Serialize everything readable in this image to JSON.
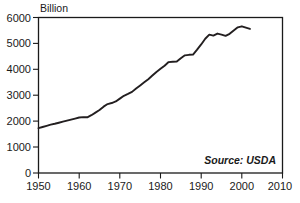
{
  "chart_data": {
    "type": "line",
    "title": "",
    "subtitle": "",
    "ylabel": "Billion",
    "xlabel": "",
    "xlim": [
      1950,
      2010
    ],
    "ylim": [
      0,
      6000
    ],
    "grid": false,
    "legend": null,
    "annotations": [
      {
        "name": "source",
        "text": "Source: USDA",
        "position": "bottom-right-inside"
      }
    ],
    "xticks": [
      1950,
      1960,
      1970,
      1980,
      1990,
      2000,
      2010
    ],
    "xtick_labels": [
      "1950",
      "1960",
      "1970",
      "1980",
      "1990",
      "2000",
      "2010"
    ],
    "yticks": [
      0,
      1000,
      2000,
      3000,
      4000,
      5000,
      6000
    ],
    "ytick_labels": [
      "0",
      "1000",
      "2000",
      "3000",
      "4000",
      "5000",
      "6000"
    ],
    "series": [
      {
        "name": "Production",
        "color": "#231f20",
        "x": [
          1950,
          1951,
          1952,
          1953,
          1954,
          1955,
          1956,
          1957,
          1958,
          1959,
          1960,
          1961,
          1962,
          1963,
          1964,
          1965,
          1966,
          1967,
          1968,
          1969,
          1970,
          1971,
          1972,
          1973,
          1974,
          1975,
          1976,
          1977,
          1978,
          1979,
          1980,
          1981,
          1982,
          1983,
          1984,
          1985,
          1986,
          1987,
          1988,
          1989,
          1990,
          1991,
          1992,
          1993,
          1994,
          1995,
          1996,
          1997,
          1998,
          1999,
          2000,
          2001,
          2002
        ],
        "values": [
          1730,
          1775,
          1820,
          1865,
          1900,
          1940,
          1980,
          2020,
          2060,
          2100,
          2140,
          2155,
          2150,
          2230,
          2330,
          2430,
          2560,
          2660,
          2700,
          2760,
          2870,
          2980,
          3050,
          3130,
          3260,
          3380,
          3500,
          3620,
          3760,
          3900,
          4020,
          4140,
          4280,
          4290,
          4300,
          4430,
          4540,
          4560,
          4570,
          4760,
          4960,
          5180,
          5340,
          5300,
          5380,
          5340,
          5290,
          5370,
          5500,
          5620,
          5660,
          5610,
          5560
        ]
      }
    ]
  },
  "axes": {
    "y_axis_title": "Billion"
  },
  "source": {
    "label": "Source: USDA"
  }
}
